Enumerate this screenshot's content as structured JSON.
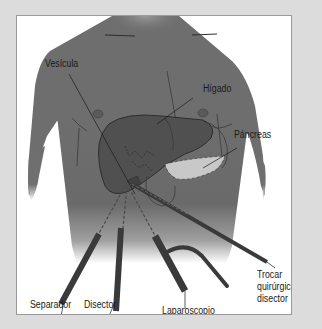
{
  "figure": {
    "labels": {
      "vesicula": "Vesícula",
      "higado": "Hígado",
      "pancreas": "Páncreas",
      "trocar_line1": "Trocar",
      "trocar_line2": "quirúrgico;",
      "trocar_line3": "disector",
      "separador": "Separador",
      "disector": "Disector",
      "laparoscopio": "Laparoscopio"
    },
    "colors": {
      "background": "#dcdcdc",
      "panel": "#ffffff",
      "body": "#6f6f6f",
      "liver": "#505050",
      "pancreas": "#c8c8c8",
      "instrument": "#3a3a3a",
      "text": "#1a1a1a"
    }
  }
}
